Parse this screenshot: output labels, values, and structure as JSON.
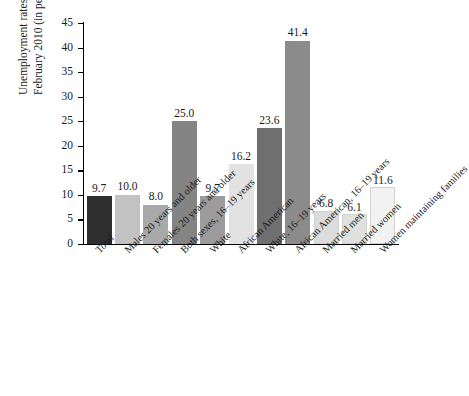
{
  "chart_data": {
    "type": "bar",
    "title": "",
    "xlabel": "",
    "ylabel_lines": [
      "Unemployment rates,",
      "February 2010 (in percent)"
    ],
    "ylabel": "Unemployment rates, February 2010 (in percent)",
    "ylim": [
      0,
      45
    ],
    "ytick_step": 5,
    "yticks": [
      "0",
      "5",
      "10",
      "15",
      "20",
      "25",
      "30",
      "35",
      "40",
      "45"
    ],
    "grid": false,
    "legend": "none",
    "categories": [
      "Total",
      "Males 20 years and older",
      "Females 20 years and older",
      "Both sexes, 16–19 years",
      "White",
      "African American",
      "White, 16–19 years",
      "African American, 16–19 years",
      "Married men",
      "Married women",
      "Women maintaining families"
    ],
    "values": [
      9.7,
      10.0,
      8.0,
      25.0,
      9.7,
      16.2,
      23.6,
      41.4,
      6.8,
      6.1,
      11.6
    ],
    "value_labels": [
      "9.7",
      "10.0",
      "8.0",
      "25.0",
      "9.7",
      "16.2",
      "23.6",
      "41.4",
      "6.8",
      "6.1",
      "11.6"
    ],
    "bar_colors": [
      "#2e2e2e",
      "#c2c2c2",
      "#a9a9a9",
      "#848484",
      "#9b9b9b",
      "#e2e2e2",
      "#6f6f6f",
      "#8b8b8b",
      "#dcdcdc",
      "#e0e0e0",
      "#f2f2f2"
    ],
    "axis_color": "#000000",
    "background_color": "#ffffff"
  }
}
